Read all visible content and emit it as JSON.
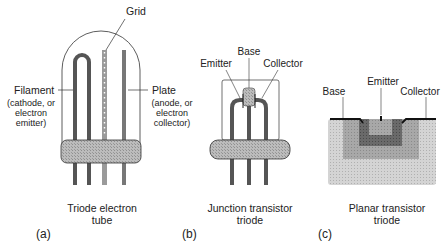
{
  "panels": {
    "a": {
      "tag": "(a)",
      "caption": [
        "Triode electron",
        "tube"
      ],
      "labels": {
        "grid": "Grid",
        "filament": "Filament",
        "filament_sub": [
          "(cathode, or",
          "electron",
          "emitter)"
        ],
        "plate": "Plate",
        "plate_sub": [
          "(anode, or",
          "electron",
          "collector)"
        ]
      }
    },
    "b": {
      "tag": "(b)",
      "caption": [
        "Junction transistor",
        "triode"
      ],
      "labels": {
        "base": "Base",
        "emitter": "Emitter",
        "collector": "Collector"
      }
    },
    "c": {
      "tag": "(c)",
      "caption": [
        "Planar transistor",
        "triode"
      ],
      "labels": {
        "base": "Base",
        "emitter": "Emitter",
        "collector": "Collector"
      }
    }
  },
  "colors": {
    "dark_fill": "#555555",
    "mid_fill": "#8a8a8a",
    "light_fill": "#bdbdbd",
    "lighter_fill": "#d6d6d6",
    "stroke": "#222222"
  }
}
